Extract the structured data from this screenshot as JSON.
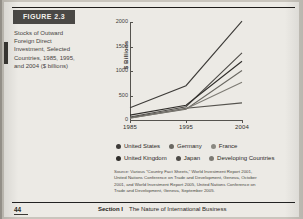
{
  "figure": {
    "chip_label": "FIGURE",
    "chip_number": "2.3",
    "caption": "Stocks of Outward Foreign Direct Investment, Selected Countries, 1985, 1995, and 2004 ($ billions)"
  },
  "chart_data": {
    "type": "line",
    "title": "Stocks of Outward Foreign Direct Investment, Selected Countries, 1985, 1995, and 2004 ($ billions)",
    "xlabel": "",
    "ylabel": "$ Billions",
    "x": [
      "1985",
      "1995",
      "2004"
    ],
    "xtick_labels": [
      "1985",
      "1995",
      "2004"
    ],
    "ytick_labels": [
      "0",
      "500",
      "1000",
      "1500",
      "2000"
    ],
    "yticks": [
      0,
      500,
      1000,
      1500,
      2000
    ],
    "ylim": [
      0,
      2000
    ],
    "grid": false,
    "legend_position": "bottom",
    "series": [
      {
        "name": "United States",
        "values": [
          250,
          700,
          2020
        ],
        "color": "#3d3b38"
      },
      {
        "name": "Germany",
        "values": [
          60,
          270,
          1370
        ],
        "color": "#4e4c48"
      },
      {
        "name": "France",
        "values": [
          40,
          220,
          1010
        ],
        "color": "#6a6862"
      },
      {
        "name": "United Kingdom",
        "values": [
          100,
          300,
          1200
        ],
        "color": "#2f2d2a"
      },
      {
        "name": "Japan",
        "values": [
          45,
          240,
          350
        ],
        "color": "#55534e"
      },
      {
        "name": "Developing Countries",
        "values": [
          35,
          230,
          770
        ],
        "color": "#7d7b74"
      }
    ]
  },
  "legend": {
    "rows": [
      [
        {
          "label": "United States",
          "color": "#3d3b38"
        },
        {
          "label": "Germany",
          "color": "#6a6862"
        },
        {
          "label": "France",
          "color": "#8b8982"
        }
      ],
      [
        {
          "label": "United Kingdom",
          "color": "#2f2d2a"
        },
        {
          "label": "Japan",
          "color": "#4e4c48"
        },
        {
          "label": "Developing Countries",
          "color": "#7d7b74"
        }
      ]
    ]
  },
  "source": {
    "text": "Source: Various “Country Fact Sheets,” World Investment Report 2001, United Nations Conference on Trade and Development, Geneva, October 2001, and World Investment Report 2005, United Nations Conference on Trade and Development, Geneva, September 2005."
  },
  "footer": {
    "page_number": "44",
    "section": "Section I",
    "section_title": "The Nature of International Business"
  }
}
